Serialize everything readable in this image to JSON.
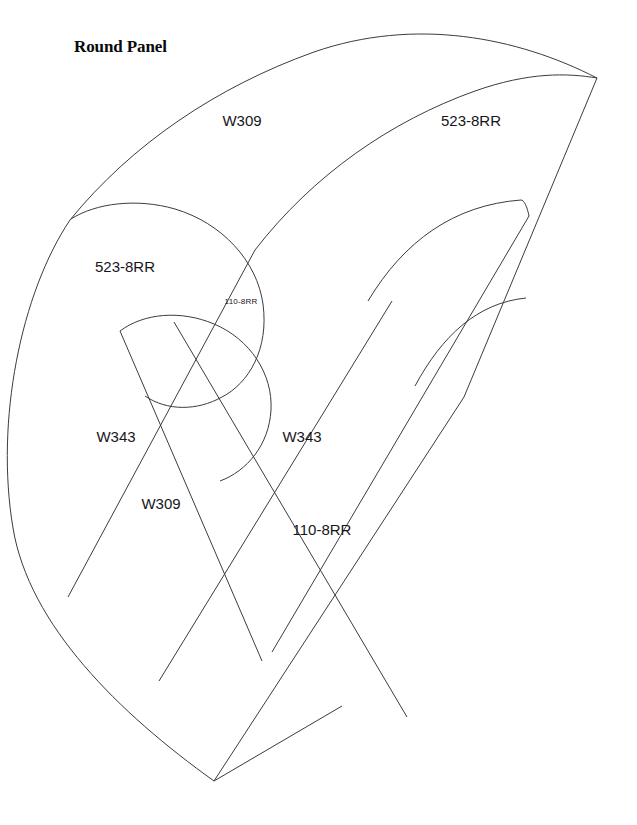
{
  "document": {
    "title": "Round Panel",
    "title_position": {
      "x": 74,
      "y": 46
    },
    "background_color": "#ffffff",
    "line_color": "#3b3b42",
    "text_color": "#16161a",
    "canvas": {
      "width": 637,
      "height": 825
    }
  },
  "chart_data": {
    "type": "diagram",
    "title": "Round Panel",
    "subtype": "cad-nesting-layout",
    "part_labels": [
      "W309",
      "523-8RR",
      "W343",
      "110-8RR"
    ],
    "regions": [
      {
        "id": "region-w309-outer",
        "label": "W309",
        "x": 242,
        "y": 122,
        "size": "lg"
      },
      {
        "id": "region-523-8rr-right",
        "label": "523-8RR",
        "x": 471,
        "y": 122,
        "size": "lg"
      },
      {
        "id": "region-523-8rr-left",
        "label": "523-8RR",
        "x": 125,
        "y": 268,
        "size": "lg"
      },
      {
        "id": "region-110-8rr-small",
        "label": "110-8RR",
        "x": 241,
        "y": 302,
        "size": "sm"
      },
      {
        "id": "region-w343-left",
        "label": "W343",
        "x": 116,
        "y": 438,
        "size": "lg"
      },
      {
        "id": "region-w343-right",
        "label": "W343",
        "x": 302,
        "y": 438,
        "size": "lg"
      },
      {
        "id": "region-w309-inner",
        "label": "W309",
        "x": 161,
        "y": 505,
        "size": "lg"
      },
      {
        "id": "region-110-8rr-lower",
        "label": "110-8RR",
        "x": 322,
        "y": 531,
        "size": "lg"
      }
    ]
  },
  "geometry": {
    "outer_boundary": "M 70 220 C 120 150 210 85 310 52 C 410 20 510 40 595 78 L 510 300 L 213 780 C 120 700 40 620 12 530 C -5 440 20 300 70 220 Z",
    "outer_arc_top": "M 70 220 C 130 146 215 88 313 53 C 414 18 516 38 596 78",
    "outer_arc_second": "M 255 250 C 312 176 390 122 474 92 C 528 73 566 74 596 78",
    "left_boundary_arc": "M 70 220 C 22 292 -4 420 13 527 C 28 624 118 712 213 780",
    "right_edge_line": "M 596 78 L 464 396",
    "bottom_edge_segment": "M 213 780 L 340 705",
    "divider_lines": [
      "M 255 250 L 69 596",
      "M 120 330 L 263 660",
      "M 173 322 L 406 716",
      "M 392 300 L 160 680",
      "M 464 396 L 213 780",
      "M 528 215 L 272 651"
    ],
    "slot_left_outer": "M 72 219 C 96 204 136 199 174 210 C 221 224 256 262 262 304 C 268 348 248 382 222 396 C 198 410 168 410 146 396",
    "slot_left_inner": "M 120 331 C 143 314 180 311 213 325 C 249 340 272 374 270 409 C 268 444 247 470 220 480",
    "slot_right_outer": "M 368 300 C 392 254 424 222 466 207 C 509 192 521 204 529 216",
    "slot_right_inner": "M 414 385 C 433 349 454 323 482 309 C 500 300 466 296 472 304",
    "arc_extra_right_top": "M 368 301 C 404 241 453 206 520 200",
    "arc_extra_right_mid": "M 415 386 C 442 336 476 304 525 298"
  }
}
